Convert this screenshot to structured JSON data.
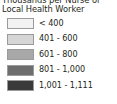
{
  "legend": {
    "title_line_1": "Thousands per Nurse or",
    "title_line_2": "Local Health Worker",
    "items": [
      {
        "label": "< 400",
        "color": "#f2f2f2"
      },
      {
        "label": "401 - 600",
        "color": "#d6d6d6"
      },
      {
        "label": "601 - 800",
        "color": "#a8a8a8"
      },
      {
        "label": "801 - 1,000",
        "color": "#6e6e6e"
      },
      {
        "label": "1,001 - 1,111",
        "color": "#3a3a3a"
      }
    ]
  },
  "chart_data": {
    "type": "bar",
    "title": "Thousands per Nurse or Local Health Worker",
    "subtitle": "",
    "xlabel": "",
    "ylabel": "",
    "legend_position": "standalone",
    "grid": false,
    "categories": [
      "< 400",
      "401 - 600",
      "601 - 800",
      "801 - 1,000",
      "1,001 - 1,111"
    ],
    "values": [
      400,
      600,
      800,
      1000,
      1111
    ],
    "bin_edges": [
      0,
      400,
      600,
      800,
      1000,
      1111
    ],
    "colors": [
      "#f2f2f2",
      "#d6d6d6",
      "#a8a8a8",
      "#6e6e6e",
      "#3a3a3a"
    ],
    "units": "thousands of people per nurse or local health worker"
  }
}
